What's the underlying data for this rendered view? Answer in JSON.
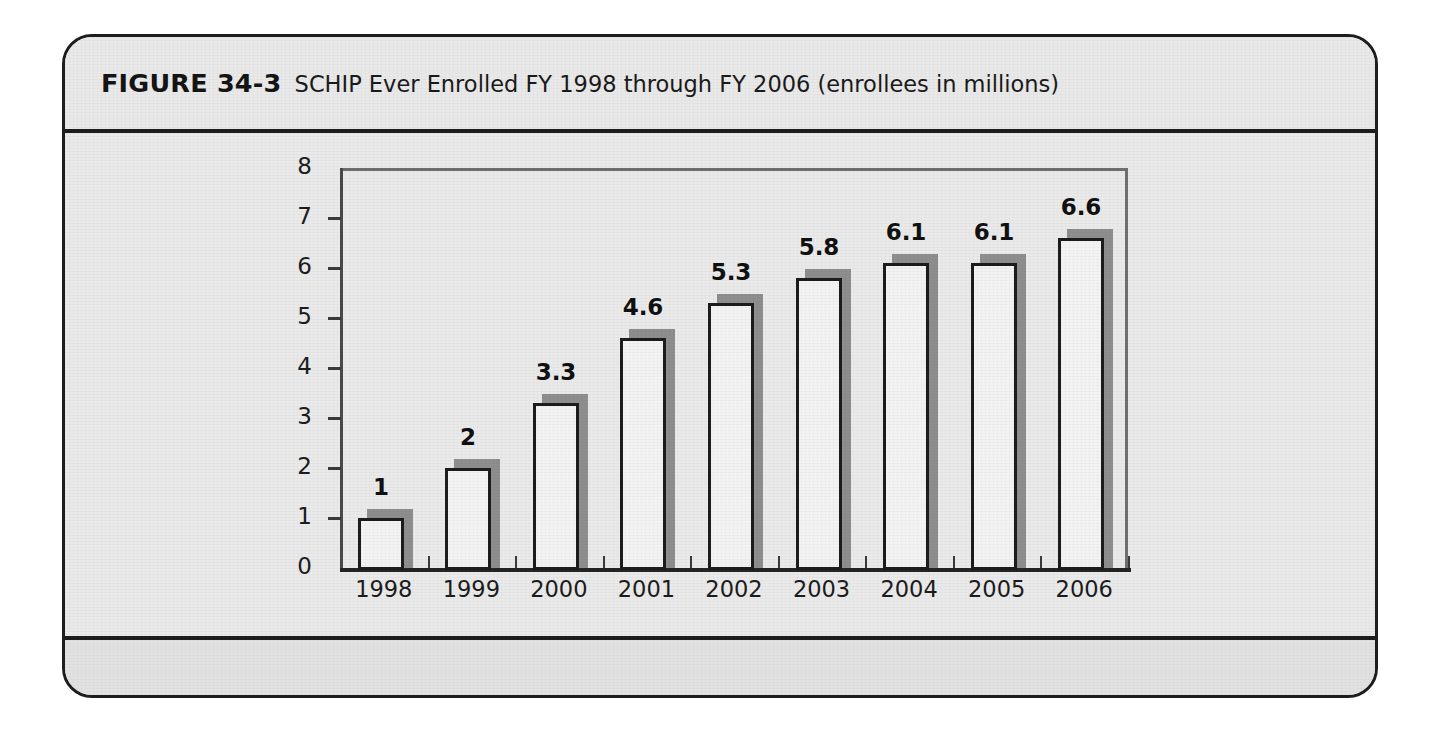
{
  "figure": {
    "number_label": "FIGURE 34-3",
    "caption": "SCHIP Ever Enrolled FY 1998 through FY 2006 (enrollees in millions)"
  },
  "colors": {
    "page_background": "#ffffff",
    "figure_background": "#eaeaea",
    "figure_border": "#1d1d1f",
    "footer_background": "#e2e2e2",
    "bar_fill": "#f3f3f3",
    "bar_outline": "#1c1c1c",
    "bar_shadow": "#8e8e8e",
    "axis": "#242424",
    "plot_frame": "#6f6f6f",
    "text": "#1a1a1a"
  },
  "chart_data": {
    "type": "bar",
    "title": "SCHIP Ever Enrolled FY 1998 through FY 2006 (enrollees in millions)",
    "xlabel": "",
    "ylabel": "",
    "categories": [
      "1998",
      "1999",
      "2000",
      "2001",
      "2002",
      "2003",
      "2004",
      "2005",
      "2006"
    ],
    "values": [
      1,
      2,
      3.3,
      4.6,
      5.3,
      5.8,
      6.1,
      6.1,
      6.6
    ],
    "value_labels": [
      "1",
      "2",
      "3.3",
      "4.6",
      "5.3",
      "5.8",
      "6.1",
      "6.1",
      "6.6"
    ],
    "ylim": [
      0,
      8
    ],
    "yticks": [
      0,
      1,
      2,
      3,
      4,
      5,
      6,
      7,
      8
    ],
    "ytick_labels": [
      "0",
      "1",
      "2",
      "3",
      "4",
      "5",
      "6",
      "7",
      "8"
    ],
    "grid": false,
    "legend": false,
    "legend_position": "none",
    "units": "millions of enrollees",
    "data_labels_shown": true
  }
}
